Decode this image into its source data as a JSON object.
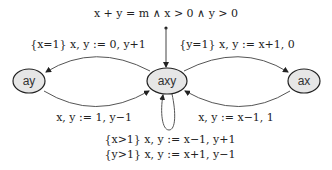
{
  "diagram": {
    "type": "state-machine",
    "initial_condition": "x + y = m ∧ x > 0 ∧ y > 0",
    "nodes": [
      {
        "id": "ay",
        "label": "ay"
      },
      {
        "id": "axy",
        "label": "axy"
      },
      {
        "id": "ax",
        "label": "ax"
      }
    ],
    "edges": [
      {
        "from": "axy",
        "to": "ay",
        "label": "{x=1} x, y := 0, y+1"
      },
      {
        "from": "ay",
        "to": "axy",
        "label": "x, y := 1, y−1"
      },
      {
        "from": "axy",
        "to": "ax",
        "label": "{y=1} x, y := x+1, 0"
      },
      {
        "from": "ax",
        "to": "axy",
        "label": "x, y := x−1, 1"
      },
      {
        "from": "axy",
        "to": "axy",
        "label_lines": [
          "{x>1} x, y := x−1, y+1",
          "{y>1} x, y := x+1, y−1"
        ]
      }
    ],
    "colors": {
      "node_fill": "#e6e6e6",
      "stroke": "#222222",
      "edge": "#555555"
    }
  }
}
